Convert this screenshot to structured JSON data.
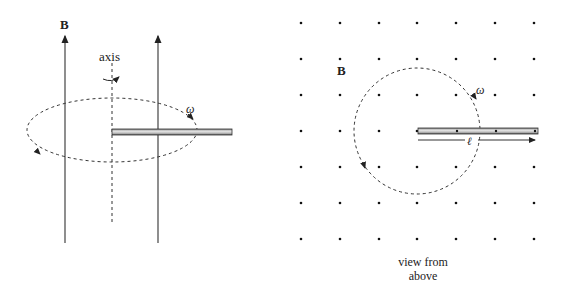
{
  "left_figure": {
    "field_label": "B",
    "axis_label": "axis",
    "omega_label": "ω",
    "description": "Rod rotating about a vertical axis in a uniform upward magnetic field (side view)"
  },
  "right_figure": {
    "field_label": "B",
    "omega_label": "ω",
    "length_label": "ℓ",
    "caption_line1": "view from",
    "caption_line2": "above",
    "dot_grid": {
      "columns_x": [
        301,
        340,
        379,
        417,
        456,
        495,
        534
      ],
      "rows_y": [
        23,
        59,
        95,
        131,
        167,
        203,
        239
      ]
    }
  },
  "colors": {
    "line": "#222222",
    "rod_fill": "#c8c8c8",
    "background": "#ffffff"
  }
}
